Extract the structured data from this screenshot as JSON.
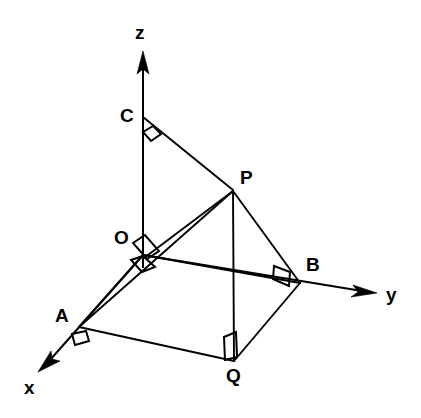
{
  "figure": {
    "type": "3d-geometry-diagram",
    "background_color": "#ffffff",
    "line_color": "#000000"
  },
  "axes": [
    {
      "id": "x",
      "label": "x",
      "label_x": 24,
      "label_y": 378,
      "origin_x": 143,
      "origin_y": 255,
      "tip_x": 39,
      "tip_y": 371
    },
    {
      "id": "y",
      "label": "y",
      "label_x": 386,
      "label_y": 285,
      "origin_x": 143,
      "origin_y": 255,
      "tip_x": 376,
      "tip_y": 293
    },
    {
      "id": "z",
      "label": "z",
      "label_x": 135,
      "label_y": 23,
      "origin_x": 143,
      "origin_y": 255,
      "tip_x": 143,
      "tip_y": 52
    }
  ],
  "points": [
    {
      "id": "O",
      "label": "O",
      "x": 143,
      "y": 255,
      "label_x": 114,
      "label_y": 228
    },
    {
      "id": "A",
      "label": "A",
      "x": 79,
      "y": 327,
      "label_x": 55,
      "label_y": 306
    },
    {
      "id": "B",
      "label": "B",
      "x": 300,
      "y": 283,
      "label_x": 306,
      "label_y": 255
    },
    {
      "id": "C",
      "label": "C",
      "x": 143,
      "y": 117,
      "label_x": 120,
      "label_y": 106
    },
    {
      "id": "P",
      "label": "P",
      "x": 233,
      "y": 190,
      "label_x": 240,
      "label_y": 168
    },
    {
      "id": "Q",
      "label": "Q",
      "x": 234,
      "y": 361,
      "label_x": 226,
      "label_y": 366
    }
  ],
  "edges": [
    {
      "id": "CP",
      "from": "C",
      "to": "P"
    },
    {
      "id": "OP",
      "from": "O",
      "to": "P"
    },
    {
      "id": "AP",
      "from": "A",
      "to": "P"
    },
    {
      "id": "BP",
      "from": "B",
      "to": "P"
    },
    {
      "id": "PQ",
      "from": "P",
      "to": "Q"
    },
    {
      "id": "AQ",
      "from": "A",
      "to": "Q"
    },
    {
      "id": "BQ",
      "from": "B",
      "to": "Q"
    },
    {
      "id": "OA",
      "from": "O",
      "to": "A"
    },
    {
      "id": "OB",
      "from": "O",
      "to": "B"
    },
    {
      "id": "OC",
      "from": "O",
      "to": "C"
    }
  ],
  "right_angle_marks": [
    {
      "id": "angle-at-C",
      "vertex": "C",
      "note": "angle between CO and CP"
    },
    {
      "id": "angle-at-O-upper",
      "vertex": "O",
      "note": "angle between OC and OB"
    },
    {
      "id": "angle-at-O-lower",
      "vertex": "O",
      "note": "angle between OA and OB"
    },
    {
      "id": "angle-at-A",
      "vertex": "A",
      "note": "angle between AO and AQ"
    },
    {
      "id": "angle-at-B",
      "vertex": "B",
      "note": "angle between BO and BQ"
    },
    {
      "id": "angle-at-Q",
      "vertex": "Q",
      "note": "angle between QA and QP"
    }
  ]
}
